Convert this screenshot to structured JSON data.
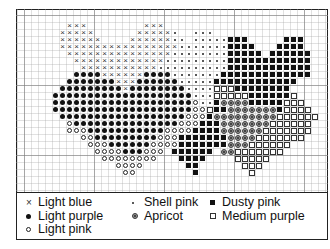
{
  "chart_data": {
    "type": "table",
    "grid": {
      "columns": 44,
      "rows": 26,
      "cell_px": 7,
      "major_every": 10
    },
    "symbol_key": {
      "x": "Light blue",
      "o": "Light purple",
      "c": "Light pink",
      "s": "Shell pink",
      "a": "Apricot",
      "d": "Dusty pink",
      "m": "Medium purple",
      "-": "empty"
    },
    "rows": [
      "--------------------------------------------",
      "--------------------------------------------",
      "-------xxx--------xxx-----------------------",
      "------xxxxx------xxxxxs--sss---------------",
      "------xxxxxx----xxxxxxss-sssssddd-----ddd---",
      "------xxxxxxxxxxxxxxxxxsssssssdddd---dddd---",
      "-------xxxxxxxxxxxxxxxssssssssddddd-dddddd--",
      "--------xxxxxxxxxxxxxsssssssssdddddddddddd--",
      "---------xxxxxxxxxxxssssssssssdddddddddddd--",
      "--------ooooxxxxxxoooosssssssddddddddddddd--",
      "-------oooooooxxxoooooosssssdddddddddddd----",
      "------oooooooooxoooooooossssmmmdddddddd-----",
      "-----oooooooooooooooooooosssmmmmmddddddm----",
      "-----oooooooooooooooooooocssdaaaadddddmmm---",
      "-----ooooooooooooooooooooccmddaaaaaaadmmmm--",
      "------oooooooooooooooooocccdaaaaaaaaammmmmm-",
      "-------cooooooooooooooocccdddaaaaaaammmmmm--",
      "-------cccoooooooooooccccddddaaaaaammmmmmm--",
      "---------ccooooooooocccdddddddaaaammmmmmm---",
      "----------cccooooooccccdddddddaaammmmmm-----",
      "-----------ccccoooccc-dddddd-aammmmmmm------",
      "------------cccccccc---dddd----mmmmm--------",
      "--------------cccc------dd------mmm---------",
      "---------------cc--------d-------m----------",
      "--------------------------------------------",
      "--------------------------------------------"
    ]
  },
  "legend": {
    "columns": [
      [
        {
          "symbol": "x",
          "label": "Light blue"
        },
        {
          "symbol": "o",
          "label": "Light purple"
        },
        {
          "symbol": "c",
          "label": "Light pink"
        }
      ],
      [
        {
          "symbol": "s",
          "label": "Shell pink"
        },
        {
          "symbol": "a",
          "label": "Apricot"
        }
      ],
      [
        {
          "symbol": "d",
          "label": "Dusty pink"
        },
        {
          "symbol": "m",
          "label": "Medium purple"
        }
      ]
    ]
  }
}
